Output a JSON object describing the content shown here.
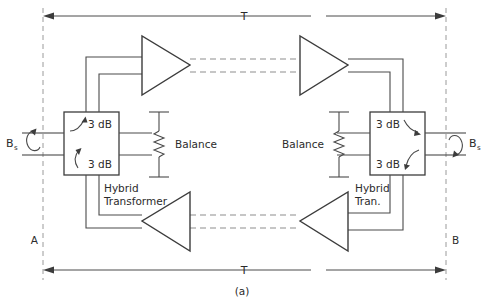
{
  "figure": {
    "caption": "(a)",
    "dimension_top_label": "T",
    "dimension_bottom_label": "T",
    "reference_left": "A",
    "reference_right": "B"
  },
  "ports": {
    "left": {
      "label": "B",
      "subscript": "s"
    },
    "right": {
      "label": "B",
      "subscript": "s"
    }
  },
  "hybrid_left": {
    "name": "Hybrid Transformer",
    "name_line1": "Hybrid",
    "name_line2": "Transformer",
    "loss_upper": "3 dB",
    "loss_lower": "3 dB",
    "balance_label": "Balance"
  },
  "hybrid_right": {
    "name": "Hybrid Tran.",
    "name_line1": "Hybrid",
    "name_line2": "Tran.",
    "loss_upper": "3 dB",
    "loss_lower": "3 dB",
    "balance_label": "Balance"
  },
  "amplifiers": [
    {
      "id": "top-left",
      "direction": "right"
    },
    {
      "id": "top-right",
      "direction": "right"
    },
    {
      "id": "bottom-left",
      "direction": "left"
    },
    {
      "id": "bottom-right",
      "direction": "left"
    }
  ],
  "colors": {
    "line": "#3c3c3c",
    "wire": "#4a4a4a",
    "dashed": "#8d8d8d",
    "guide": "#9a9a9a",
    "text": "#2b2b2b",
    "background": "#ffffff"
  }
}
